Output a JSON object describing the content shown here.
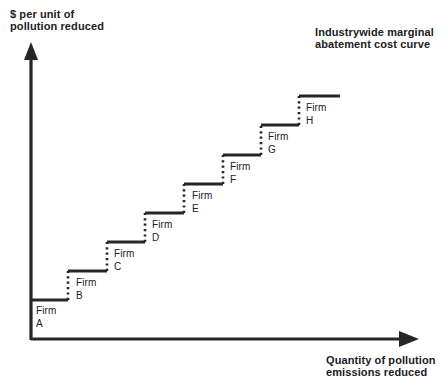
{
  "figure": {
    "title": "Industrywide marginal\nabatement cost curve",
    "y_axis_label": "$ per unit of\npollution reduced",
    "x_axis_label": "Quantity of pollution\nemissions reduced",
    "ink_color": "#262626",
    "background_color": "#ffffff"
  },
  "chart_data": {
    "type": "bar",
    "title": "Industrywide marginal abatement cost curve",
    "xlabel": "Quantity of pollution emissions reduced",
    "ylabel": "$ per unit of pollution reduced",
    "grid": false,
    "legend": null,
    "axes": {
      "x_origin_px": 31,
      "y_origin_px": 340,
      "x_arrow_end_px": 418,
      "y_arrow_top_px": 45,
      "x_range_units": [
        0,
        8
      ],
      "y_range_units": [
        0,
        9
      ],
      "tick_labels_x": [],
      "tick_labels_y": []
    },
    "note": "Step (staircase) marginal abatement cost curve: each firm abates one equal increment of pollution, ordered from lowest to highest marginal cost. Heights are read off the vertical axis in relative cost units; widths are equal quantity increments.",
    "categories": [
      "Firm A",
      "Firm B",
      "Firm C",
      "Firm D",
      "Firm E",
      "Firm F",
      "Firm G",
      "Firm H"
    ],
    "values": [
      1,
      2,
      3,
      4,
      5,
      6,
      7,
      8
    ],
    "steps": [
      {
        "label": "Firm\nA",
        "firm": "A",
        "name_line1": "Firm",
        "name_line2": "A",
        "x0_px": 31,
        "x1_px": 68,
        "y_px": 300,
        "label_x_px": 36,
        "label_y_px": 304
      },
      {
        "label": "Firm\nB",
        "firm": "B",
        "name_line1": "Firm",
        "name_line2": "B",
        "x0_px": 68,
        "x1_px": 107,
        "y_px": 271,
        "label_x_px": 76,
        "label_y_px": 276
      },
      {
        "label": "Firm\nC",
        "firm": "C",
        "name_line1": "Firm",
        "name_line2": "C",
        "x0_px": 107,
        "x1_px": 145,
        "y_px": 242,
        "label_x_px": 114,
        "label_y_px": 247
      },
      {
        "label": "Firm\nD",
        "firm": "D",
        "name_line1": "Firm",
        "name_line2": "D",
        "x0_px": 145,
        "x1_px": 184,
        "y_px": 213,
        "label_x_px": 152,
        "label_y_px": 218
      },
      {
        "label": "Firm\nE",
        "firm": "E",
        "name_line1": "Firm",
        "name_line2": "E",
        "x0_px": 184,
        "x1_px": 223,
        "y_px": 184,
        "label_x_px": 192,
        "label_y_px": 189
      },
      {
        "label": "Firm\nF",
        "firm": "F",
        "name_line1": "Firm",
        "name_line2": "F",
        "x0_px": 223,
        "x1_px": 261,
        "y_px": 155,
        "label_x_px": 230,
        "label_y_px": 160
      },
      {
        "label": "Firm\nG",
        "firm": "G",
        "name_line1": "Firm",
        "name_line2": "G",
        "x0_px": 261,
        "x1_px": 299,
        "y_px": 125,
        "label_x_px": 268,
        "label_y_px": 130
      },
      {
        "label": "Firm\nH",
        "firm": "H",
        "name_line1": "Firm",
        "name_line2": "H",
        "x0_px": 299,
        "x1_px": 340,
        "y_px": 96,
        "label_x_px": 306,
        "label_y_px": 101
      }
    ]
  }
}
